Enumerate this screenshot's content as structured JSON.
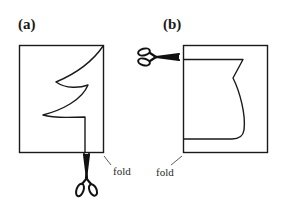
{
  "figure": {
    "panels": [
      {
        "id": "a",
        "label": "(a)",
        "fold_label": "fold",
        "description": "Folded paper rectangle with half-tree outline along fold; scissors cutting upward from bottom"
      },
      {
        "id": "b",
        "label": "(b)",
        "fold_label": "fold",
        "description": "Folded paper rectangle with half-vase outline along fold; scissors cutting from left"
      }
    ],
    "colors": {
      "line": "#1a1a1a",
      "background": "#ffffff"
    }
  }
}
